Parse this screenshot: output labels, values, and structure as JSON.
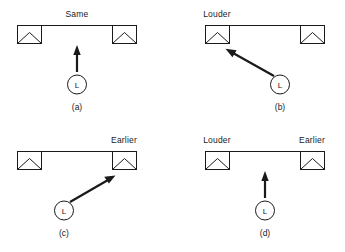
{
  "figure": {
    "background_color": "#ffffff",
    "line_color": "#1a1a1a",
    "panels": [
      {
        "id": "a",
        "caption": "(a)",
        "left_speaker_label": "",
        "center_label": "Same",
        "right_speaker_label": "",
        "listener_label": "L",
        "arrow_direction": "up",
        "arrow_target": "center"
      },
      {
        "id": "b",
        "caption": "(b)",
        "left_speaker_label": "Louder",
        "center_label": "",
        "right_speaker_label": "",
        "listener_label": "L",
        "arrow_direction": "up-left",
        "arrow_target": "left-speaker"
      },
      {
        "id": "c",
        "caption": "(c)",
        "left_speaker_label": "",
        "center_label": "",
        "right_speaker_label": "Earlier",
        "listener_label": "L",
        "arrow_direction": "up-right",
        "arrow_target": "right-speaker"
      },
      {
        "id": "d",
        "caption": "(d)",
        "left_speaker_label": "Louder",
        "center_label": "",
        "right_speaker_label": "Earlier",
        "listener_label": "L",
        "arrow_direction": "up",
        "arrow_target": "center"
      }
    ]
  }
}
